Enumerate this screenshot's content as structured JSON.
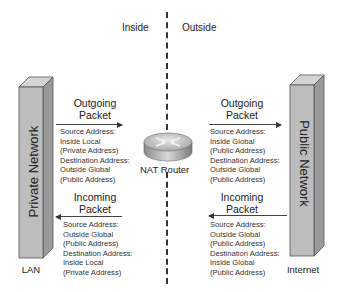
{
  "zones": {
    "inside": "Inside",
    "outside": "Outside"
  },
  "router": {
    "label": "NAT Router",
    "icon": "router-icon"
  },
  "left_block": {
    "title": "Private Network",
    "caption": "LAN",
    "color": "#b8b8b8"
  },
  "right_block": {
    "title": "Public Network",
    "caption": "Internet",
    "color": "#b8b8b8"
  },
  "left_outgoing": {
    "title_line1": "Outgoing",
    "title_line2": "Packet",
    "direction": "right",
    "lines": [
      "Source Address:",
      "Inside Local",
      "(Private Address)",
      "Destination Address:",
      "Outside Global",
      "(Public Address)"
    ]
  },
  "left_incoming": {
    "title_line1": "Incoming",
    "title_line2": "Packet",
    "direction": "left",
    "lines": [
      "Source Address:",
      "Outside Global",
      "(Public Address)",
      "Destination Address:",
      "Inside Local",
      "(Private Address)"
    ]
  },
  "right_outgoing": {
    "title_line1": "Outgoing",
    "title_line2": "Packet",
    "direction": "right",
    "lines": [
      "Source Address:",
      "Inside Global",
      "(Public Address)",
      "Destination Address:",
      "Outside Global",
      "(Public Address)"
    ]
  },
  "right_incoming": {
    "title_line1": "Incoming",
    "title_line2": "Packet",
    "direction": "left",
    "lines": [
      "Source Address:",
      "Outside Global",
      "(Public Address)",
      "Destination Address:",
      "Inside Global",
      "(Public Address)"
    ]
  }
}
